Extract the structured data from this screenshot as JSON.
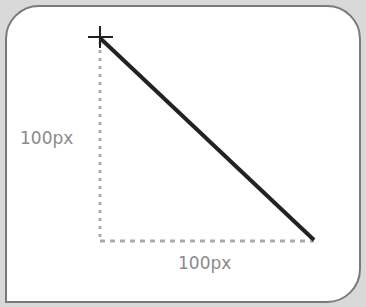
{
  "diagram": {
    "vertical_label": "100px",
    "horizontal_label": "100px",
    "start_marker": "crosshair-icon",
    "line": {
      "x1": 100,
      "y1": 38,
      "x2": 314,
      "y2": 240,
      "color": "#222222"
    },
    "guide_color": "#aaaaaa",
    "border_color": "#7a7a7a"
  }
}
